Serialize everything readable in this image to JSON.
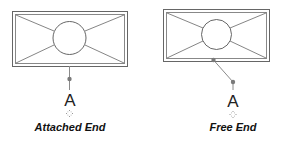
{
  "panels": [
    {
      "id": "attached",
      "caption": "Attached End",
      "tag_letter": "A"
    },
    {
      "id": "free",
      "caption": "Free End",
      "tag_letter": "A"
    }
  ],
  "colors": {
    "stroke": "#555555",
    "frame_outer": "#666666",
    "frame_inner": "#888888",
    "leader": "#8a8a8a",
    "leader_dot": "#7a7a7a",
    "move_grip": "#999999",
    "caption": "#111111"
  }
}
